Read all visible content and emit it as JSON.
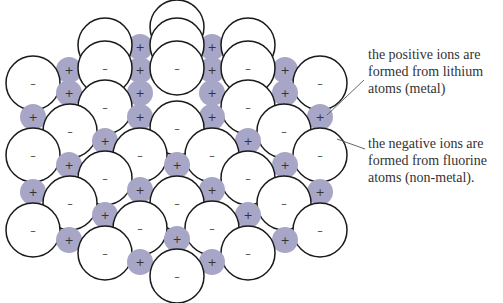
{
  "diagram": {
    "colors": {
      "positive_ion_fill": "#a8a6c6",
      "negative_ion_fill": "#ffffff",
      "outline": "#1a1a1a",
      "text": "#333333"
    },
    "symbols": {
      "positive": "+",
      "negative": "–"
    },
    "annotations": [
      {
        "id": "positive",
        "lines": [
          "the positive ions are",
          "formed from lithium",
          "atoms (metal)"
        ]
      },
      {
        "id": "negative",
        "lines": [
          "the negative ions are",
          "formed from fluorine",
          "atoms (non-metal)."
        ]
      }
    ]
  }
}
